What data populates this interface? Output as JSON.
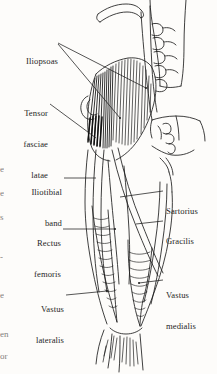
{
  "figure": {
    "background_color": "#fdfcfa",
    "ink_color": "#1d1d1d",
    "labels_left": [
      {
        "id": "iliopsoas",
        "text": "Iliopsoas",
        "lines": [
          "Iliopsoas"
        ]
      },
      {
        "id": "tensor-fasciae-latae",
        "text": "Tensor fasciae latae",
        "lines": [
          "Tensor",
          "fasciae",
          "latae"
        ]
      },
      {
        "id": "iliotibial-band",
        "text": "Iliotibial band",
        "lines": [
          "Iliotibial",
          "band"
        ]
      },
      {
        "id": "rectus-femoris",
        "text": "Rectus femoris",
        "lines": [
          "Rectus",
          "femoris"
        ]
      },
      {
        "id": "vastus-lateralis",
        "text": "Vastus lateralis",
        "lines": [
          "Vastus",
          "lateralis"
        ]
      }
    ],
    "labels_right": [
      {
        "id": "sartorius",
        "text": "Sartorius",
        "lines": [
          "Sartorius"
        ]
      },
      {
        "id": "gracilis",
        "text": "Gracilis",
        "lines": [
          "Gracilis"
        ]
      },
      {
        "id": "vastus-medialis",
        "text": "Vastus medialis",
        "lines": [
          "Vastus",
          "medialis"
        ]
      }
    ],
    "margin_fragments": [
      "e",
      "e",
      "s",
      "-",
      "e",
      "en",
      "or"
    ]
  }
}
